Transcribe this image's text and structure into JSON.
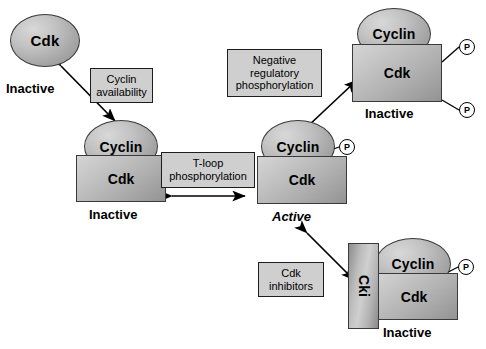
{
  "diagram": {
    "complexes": [
      {
        "id": "free-cdk",
        "cdk_label": "Cdk",
        "state": "Inactive"
      },
      {
        "id": "cyclin-cdk-inactive",
        "cyclin_label": "Cyclin",
        "cdk_label": "Cdk",
        "state": "Inactive"
      },
      {
        "id": "cyclin-cdk-active",
        "cyclin_label": "Cyclin",
        "cdk_label": "Cdk",
        "state": "Active",
        "phosphates": [
          "P"
        ]
      },
      {
        "id": "cyclin-cdk-inhibited-phos",
        "cyclin_label": "Cyclin",
        "cdk_label": "Cdk",
        "state": "Inactive",
        "phosphates": [
          "P",
          "P"
        ]
      },
      {
        "id": "cyclin-cdk-cki",
        "cki_label": "Cki",
        "cyclin_label": "Cyclin",
        "cdk_label": "Cdk",
        "state": "Inactive",
        "phosphates": [
          "P"
        ]
      }
    ],
    "process_labels": [
      {
        "id": "cyclin-availability",
        "lines": [
          "Cyclin",
          "availability"
        ]
      },
      {
        "id": "t-loop-phosphorylation",
        "lines": [
          "T-loop",
          "phosphorylation"
        ]
      },
      {
        "id": "negative-regulatory-phosphorylation",
        "lines": [
          "Negative",
          "regulatory",
          "phosphorylation"
        ]
      },
      {
        "id": "cdk-inhibitors",
        "lines": [
          "Cdk",
          "inhibitors"
        ]
      }
    ],
    "phosphate_symbol": "P",
    "colors": {
      "shape_border": "#3a3a3a",
      "label_box_fill": "#cfcfcf",
      "label_box_border": "#1d1d1d",
      "arrow": "#000000",
      "background": "#ffffff"
    }
  }
}
